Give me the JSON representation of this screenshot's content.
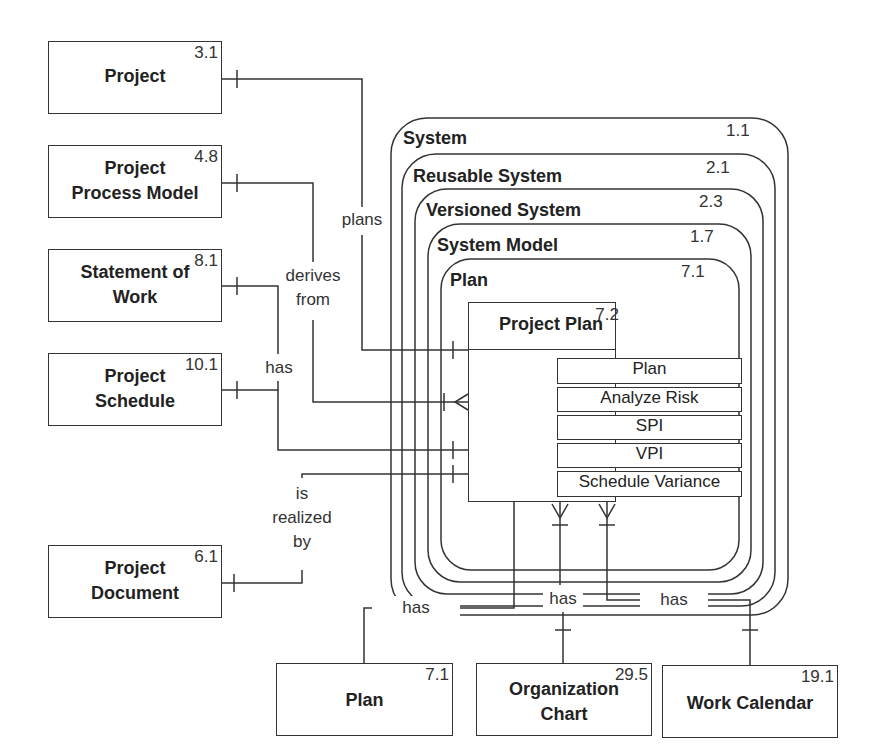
{
  "entities": {
    "project": {
      "name_lines": [
        "Project"
      ],
      "num": "3.1"
    },
    "project_process_model": {
      "name_lines": [
        "Project",
        "Process Model"
      ],
      "num": "4.8"
    },
    "statement_of_work": {
      "name_lines": [
        "Statement of",
        "Work"
      ],
      "num": "8.1"
    },
    "project_schedule": {
      "name_lines": [
        "Project",
        "Schedule"
      ],
      "num": "10.1"
    },
    "project_document": {
      "name_lines": [
        "Project",
        "Document"
      ],
      "num": "6.1"
    },
    "plan": {
      "name_lines": [
        "Plan"
      ],
      "num": "7.1"
    },
    "organization_chart": {
      "name_lines": [
        "Organization",
        "Chart"
      ],
      "num": "29.5"
    },
    "work_calendar": {
      "name_lines": [
        "Work Calendar"
      ],
      "num": "19.1"
    }
  },
  "nested_types": [
    {
      "label": "System",
      "num": "1.1"
    },
    {
      "label": "Reusable System",
      "num": "2.1"
    },
    {
      "label": "Versioned System",
      "num": "2.3"
    },
    {
      "label": "System Model",
      "num": "1.7"
    },
    {
      "label": "Plan",
      "num": "7.1"
    }
  ],
  "central": {
    "title": "Project Plan",
    "num": "7.2",
    "operations": [
      "Plan",
      "Analyze Risk",
      "SPI",
      "VPI",
      "Schedule Variance"
    ]
  },
  "relationships": {
    "plans": "plans",
    "derives_from": [
      "derives",
      "from"
    ],
    "has_schedule": "has",
    "is_realized_by": [
      "is",
      "realized",
      "by"
    ],
    "has_plan": "has",
    "has_org_chart": "has",
    "has_work_calendar": "has"
  }
}
